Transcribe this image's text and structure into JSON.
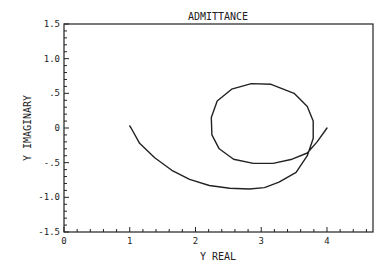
{
  "chart_data": {
    "type": "line",
    "title": "ADMITTANCE",
    "xlabel": "Y REAL",
    "ylabel": "Y IMAGINARY",
    "xlim": [
      0,
      4.7
    ],
    "ylim": [
      -1.5,
      1.5
    ],
    "grid": false,
    "legend": null,
    "x_ticks": [
      "0",
      "1",
      "2",
      "3",
      "4"
    ],
    "y_ticks": [
      "1.5",
      "1.0",
      ".5",
      "0",
      "-.5",
      "-1.0",
      "-1.5"
    ],
    "series": [
      {
        "name": "admittance locus",
        "x": [
          1.0,
          1.02,
          1.15,
          1.38,
          1.64,
          1.91,
          2.21,
          2.52,
          2.82,
          3.05,
          3.27,
          3.53,
          3.7,
          3.79,
          3.79,
          3.7,
          3.5,
          3.15,
          2.85,
          2.55,
          2.33,
          2.24,
          2.25,
          2.36,
          2.58,
          2.88,
          3.18,
          3.47,
          3.7,
          3.85,
          4.0
        ],
        "y": [
          0.03,
          0.0,
          -0.22,
          -0.43,
          -0.61,
          -0.74,
          -0.83,
          -0.87,
          -0.88,
          -0.86,
          -0.78,
          -0.64,
          -0.4,
          -0.15,
          0.1,
          0.31,
          0.5,
          0.63,
          0.64,
          0.56,
          0.39,
          0.15,
          -0.1,
          -0.3,
          -0.45,
          -0.51,
          -0.51,
          -0.45,
          -0.36,
          -0.2,
          0.0
        ]
      }
    ]
  },
  "labels": {
    "title": "ADMITTANCE",
    "xlabel": "Y REAL",
    "ylabel": "Y IMAGINARY",
    "x_ticks": [
      "0",
      "1",
      "2",
      "3",
      "4"
    ],
    "y_ticks": [
      "1.5",
      "1.0",
      ".5",
      "0",
      "-.5",
      "-1.0",
      "-1.5"
    ]
  }
}
